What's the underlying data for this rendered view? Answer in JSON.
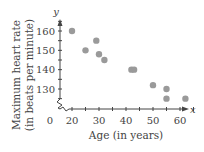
{
  "chart_data": {
    "type": "scatter",
    "title": "",
    "xlabel": "Age (in years)",
    "ylabel": "Maximum heart rate (in beats per minute)",
    "ylabel_line1": "Maximum heart rate",
    "ylabel_line2": "(in beats per minute)",
    "x_axis_letter": "x",
    "y_axis_letter": "y",
    "origin_label": "0",
    "x_ticks": [
      20,
      30,
      40,
      50,
      60
    ],
    "y_ticks": [
      130,
      140,
      150,
      160
    ],
    "xlim": [
      0,
      65
    ],
    "ylim": [
      120,
      165
    ],
    "axis_break": true,
    "grid": false,
    "points": [
      {
        "x": 20,
        "y": 160
      },
      {
        "x": 25,
        "y": 150
      },
      {
        "x": 29,
        "y": 155
      },
      {
        "x": 30,
        "y": 148
      },
      {
        "x": 32,
        "y": 145
      },
      {
        "x": 42,
        "y": 140
      },
      {
        "x": 43,
        "y": 140
      },
      {
        "x": 50,
        "y": 132
      },
      {
        "x": 55,
        "y": 130
      },
      {
        "x": 55,
        "y": 125
      },
      {
        "x": 62,
        "y": 125
      }
    ],
    "point_color": "#9a9a9a"
  }
}
